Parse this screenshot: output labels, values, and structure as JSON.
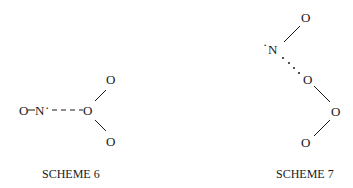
{
  "schemes": [
    {
      "label": "SCHEME 6",
      "atoms": {
        "o_left": "O",
        "n": "N",
        "n_radical": "·",
        "o_center": "O",
        "o_top": "O",
        "o_bottom": "O"
      },
      "interaction": "dashed"
    },
    {
      "label": "SCHEME 7",
      "atoms": {
        "o_top": "O",
        "n_radical": "·",
        "n": "N",
        "o_middle": "O",
        "o_right": "O",
        "o_bottom": "O"
      },
      "interaction": "dotted"
    }
  ]
}
